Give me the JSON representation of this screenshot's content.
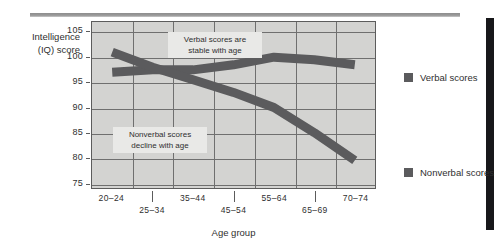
{
  "chart_data": {
    "type": "line",
    "title": "",
    "xlabel": "Age group",
    "ylabel": "Intelligence (IQ) score",
    "ylabel_line1": "Intelligence",
    "ylabel_line2": "(IQ) score",
    "categories": [
      "20–24",
      "25–34",
      "35–44",
      "45–54",
      "55–64",
      "65–69",
      "70–74"
    ],
    "yticks": [
      105,
      100,
      95,
      90,
      85,
      80,
      75
    ],
    "ylim": [
      74,
      107
    ],
    "grid": true,
    "legend_position": "right",
    "series": [
      {
        "name": "Verbal scores",
        "color": "#5b5b5d",
        "values": [
          97,
          97.5,
          97.5,
          98.5,
          100,
          99.5,
          98.5
        ]
      },
      {
        "name": "Nonverbal scores",
        "color": "#5b5b5d",
        "values": [
          101,
          98,
          95.5,
          93,
          90,
          85,
          79.5
        ]
      }
    ],
    "annotations": [
      {
        "id": "verbal-annotation",
        "line1": "Verbal scores are",
        "line2": "stable with age"
      },
      {
        "id": "nonverbal-annotation",
        "line1": "Nonverbal scores",
        "line2": "decline with age"
      }
    ]
  },
  "legend": {
    "items": [
      {
        "label": "Verbal scores"
      },
      {
        "label": "Nonverbal scores"
      }
    ]
  }
}
